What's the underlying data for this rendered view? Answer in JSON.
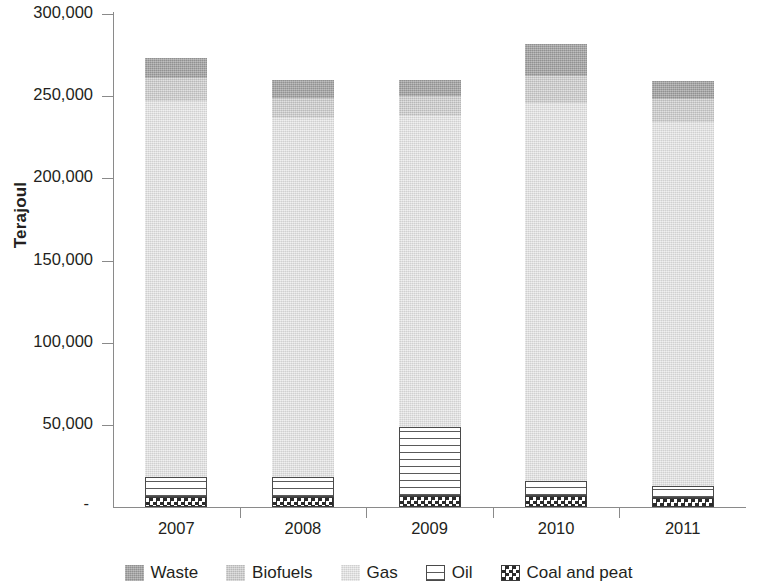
{
  "chart_data": {
    "type": "bar",
    "subtype": "stacked-column",
    "title": "",
    "xlabel": "",
    "ylabel": "Terajoul",
    "categories": [
      "2007",
      "2008",
      "2009",
      "2010",
      "2011"
    ],
    "ylim": [
      0,
      300000
    ],
    "y_ticks": [
      0,
      50000,
      100000,
      150000,
      200000,
      250000,
      300000
    ],
    "y_tick_labels": [
      "-",
      "50,000",
      "100,000",
      "150,000",
      "200,000",
      "250,000",
      "300,000"
    ],
    "grid": false,
    "legend_position": "bottom",
    "stack_order_bottom_to_top": [
      "Coal and peat",
      "Oil",
      "Gas",
      "Biofuels",
      "Waste"
    ],
    "series": [
      {
        "name": "Coal and peat",
        "color": "#2b2b2b",
        "pattern": "checkerboard",
        "values": [
          6000,
          6000,
          6500,
          6500,
          5500
        ]
      },
      {
        "name": "Oil",
        "color": "#5a5a5a",
        "pattern": "horizontal-lines",
        "values": [
          12000,
          12500,
          42000,
          9500,
          7000
        ]
      },
      {
        "name": "Gas",
        "color": "#e2e2e2",
        "pattern": "solid-light",
        "values": [
          229000,
          218500,
          189500,
          230000,
          221500
        ]
      },
      {
        "name": "Biofuels",
        "color": "#cfcfcf",
        "pattern": "solid-medium",
        "values": [
          14000,
          12000,
          12000,
          16000,
          14000
        ]
      },
      {
        "name": "Waste",
        "color": "#a6a6a6",
        "pattern": "solid-dark",
        "values": [
          12000,
          11000,
          10000,
          20000,
          11500
        ]
      }
    ],
    "totals": [
      273000,
      260000,
      260000,
      282000,
      259500
    ]
  },
  "legend": {
    "items": [
      {
        "label": "Waste",
        "swatch": "waste-swatch"
      },
      {
        "label": "Biofuels",
        "swatch": "biofuels-swatch"
      },
      {
        "label": "Gas",
        "swatch": "gas-swatch"
      },
      {
        "label": "Oil",
        "swatch": "oil-swatch"
      },
      {
        "label": "Coal and peat",
        "swatch": "coal-and-peat-swatch"
      }
    ]
  },
  "axes": {
    "y_title": "Terajoul",
    "y_tick_labels": [
      "300,000",
      "250,000",
      "200,000",
      "150,000",
      "100,000",
      "50,000",
      "-"
    ],
    "x_tick_labels": [
      "2007",
      "2008",
      "2009",
      "2010",
      "2011"
    ]
  }
}
